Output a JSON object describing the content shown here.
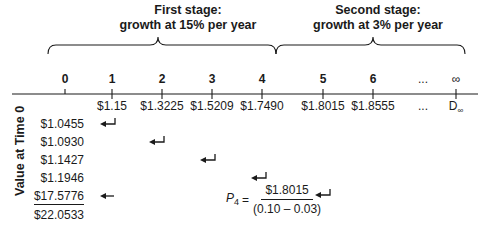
{
  "stages": [
    {
      "title_line1": "First stage:",
      "title_line2": "growth at 15% per year",
      "rate": "15%"
    },
    {
      "title_line1": "Second stage:",
      "title_line2": "growth at 3% per year",
      "rate": "3%"
    }
  ],
  "timeline": {
    "periods": [
      "0",
      "1",
      "2",
      "3",
      "4",
      "5",
      "6",
      "...",
      "∞"
    ],
    "cash_flows": [
      "",
      "$1.15",
      "$1.3225",
      "$1.5209",
      "$1.7490",
      "$1.8015",
      "$1.8555",
      "...",
      "D"
    ],
    "terminal_subscript": "∞"
  },
  "value_at_time0": {
    "label": "Value at Time 0",
    "values": [
      "$1.0455",
      "$1.0930",
      "$1.1427",
      "$1.1946",
      "$17.5776"
    ],
    "total": "$22.0533"
  },
  "formula": {
    "lhs": "P",
    "lhs_subscript": "4",
    "equals": "=",
    "numerator": "$1.8015",
    "denominator": "(0.10 – 0.03)"
  },
  "colors": {
    "ink": "#1a1a1a",
    "background": "#ffffff"
  }
}
